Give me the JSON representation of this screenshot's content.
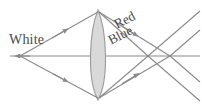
{
  "figure": {
    "background_color": "#ffffff",
    "width": 202,
    "height": 106
  },
  "labels": {
    "white": "White",
    "red": "Red",
    "blue": "Blue"
  },
  "colors": {
    "stroke": "#8a8a8a",
    "axis": "#8a8a8a",
    "lens_fill": "#d9d9d9",
    "lens_stroke": "#9a9a9a",
    "text": "#4a4a4a"
  },
  "diagram_data": {
    "type": "ray-diagram",
    "source_point": {
      "x": 20,
      "y": 56
    },
    "optical_axis": {
      "x1": 8,
      "y1": 56,
      "x2": 200,
      "y2": 56
    },
    "lens": {
      "shape": "biconvex",
      "center_x": 98,
      "top_apex_y": 10,
      "bottom_apex_y": 100,
      "half_width": 11
    },
    "focal_points": [
      {
        "name": "blue-focus",
        "x": 148,
        "y": 56
      },
      {
        "name": "red-focus",
        "x": 170,
        "y": 56
      }
    ],
    "rays": [
      {
        "name": "upper-incident-ray",
        "from": [
          20,
          56
        ],
        "to": [
          98,
          12
        ]
      },
      {
        "name": "lower-incident-ray",
        "from": [
          20,
          56
        ],
        "to": [
          98,
          98
        ]
      },
      {
        "name": "upper-blue-refracted-ray",
        "from": [
          98,
          12
        ],
        "to": [
          148,
          56
        ]
      },
      {
        "name": "upper-red-refracted-ray",
        "from": [
          98,
          12
        ],
        "to": [
          170,
          56
        ]
      },
      {
        "name": "lower-blue-refracted-ray",
        "from": [
          98,
          98
        ],
        "to": [
          148,
          56
        ]
      },
      {
        "name": "lower-red-refracted-ray",
        "from": [
          98,
          98
        ],
        "to": [
          170,
          56
        ]
      },
      {
        "name": "upper-blue-diverging-ray",
        "from": [
          148,
          56
        ],
        "to": [
          200,
          101
        ]
      },
      {
        "name": "upper-red-diverging-ray",
        "from": [
          170,
          56
        ],
        "to": [
          200,
          81
        ]
      },
      {
        "name": "lower-blue-diverging-ray",
        "from": [
          148,
          56
        ],
        "to": [
          200,
          11
        ]
      },
      {
        "name": "lower-red-diverging-ray",
        "from": [
          170,
          56
        ],
        "to": [
          200,
          31
        ]
      }
    ]
  }
}
